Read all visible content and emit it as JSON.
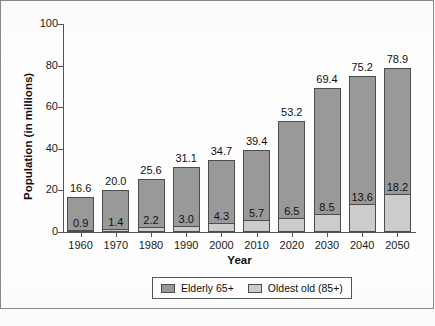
{
  "chart_data": {
    "type": "bar",
    "stacked": true,
    "title": "",
    "xlabel": "Year",
    "ylabel": "Population (in millions)",
    "categories": [
      "1960",
      "1970",
      "1980",
      "1990",
      "2000",
      "2010",
      "2020",
      "2030",
      "2040",
      "2050"
    ],
    "series": [
      {
        "name": "Elderly 65+",
        "color": "#999999",
        "values": [
          16.6,
          20.0,
          25.6,
          31.1,
          34.7,
          39.4,
          53.2,
          69.4,
          75.2,
          78.9
        ],
        "labels": [
          "16.6",
          "20.0",
          "25.6",
          "31.1",
          "34.7",
          "39.4",
          "53.2",
          "69.4",
          "75.2",
          "78.9"
        ]
      },
      {
        "name": "Oldest old (85+)",
        "color": "#cccccc",
        "values": [
          0.9,
          1.4,
          2.2,
          3.0,
          4.3,
          5.7,
          6.5,
          8.5,
          13.6,
          18.2
        ],
        "labels": [
          "0.9",
          "1.4",
          "2.2",
          "3.0",
          "4.3",
          "5.7",
          "6.5",
          "8.5",
          "13.6",
          "18.2"
        ]
      }
    ],
    "ylim": [
      0,
      100
    ],
    "yticks": [
      0,
      20,
      40,
      60,
      80,
      100
    ],
    "ytick_labels": [
      "0",
      "20",
      "40",
      "60",
      "80",
      "100"
    ],
    "grid": false,
    "legend_position": "bottom-center"
  },
  "legend": {
    "entries": [
      {
        "label": "Elderly 65+",
        "color": "#999999"
      },
      {
        "label": "Oldest old (85+)",
        "color": "#cccccc"
      }
    ]
  }
}
